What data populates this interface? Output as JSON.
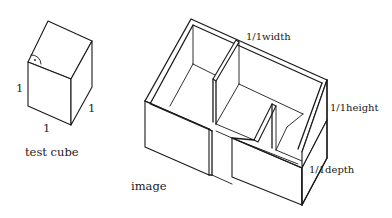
{
  "figure": {
    "test_cube": {
      "caption": "test cube",
      "dimension_labels": {
        "height": "1",
        "width": "1",
        "depth": "1"
      },
      "right_angle_marker": "·"
    },
    "image_model": {
      "caption": "image",
      "dimension_labels": {
        "width": "1/1width",
        "height": "1/1height",
        "depth": "1/1depth"
      }
    },
    "colors": {
      "ink": "#1a1a1a",
      "background": "#ffffff"
    }
  }
}
